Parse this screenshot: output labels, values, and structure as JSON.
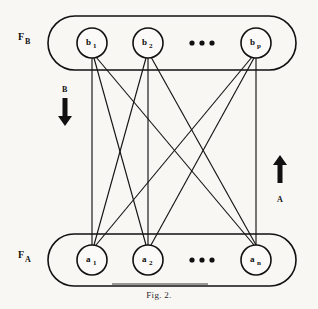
{
  "figure": {
    "caption": "Fig. 2.",
    "background_color": "#f8f7f4",
    "ink_color": "#111111"
  },
  "fields": {
    "top": {
      "label_main": "F",
      "label_sub": "B",
      "name": "F_B"
    },
    "bottom": {
      "label_main": "F",
      "label_sub": "A",
      "name": "F_A"
    }
  },
  "nodes": {
    "top_layer": [
      {
        "main": "b",
        "sub": "1",
        "cx": 92,
        "cy": 43
      },
      {
        "main": "b",
        "sub": "2",
        "cx": 148,
        "cy": 43
      },
      {
        "main": "b",
        "sub": "p",
        "cx": 256,
        "cy": 43
      }
    ],
    "bottom_layer": [
      {
        "main": "a",
        "sub": "1",
        "cx": 92,
        "cy": 260
      },
      {
        "main": "a",
        "sub": "2",
        "cx": 148,
        "cy": 260
      },
      {
        "main": "a",
        "sub": "n",
        "cx": 256,
        "cy": 260
      }
    ],
    "radius": 15
  },
  "ellipsis": {
    "glyph": "•",
    "count": 3,
    "top_y": 43,
    "bottom_y": 260,
    "x_positions": [
      192,
      202,
      212
    ]
  },
  "edges": {
    "description": "fully connected bipartite links",
    "pairs": [
      [
        0,
        0
      ],
      [
        0,
        1
      ],
      [
        0,
        2
      ],
      [
        1,
        0
      ],
      [
        1,
        1
      ],
      [
        1,
        2
      ],
      [
        2,
        0
      ],
      [
        2,
        1
      ],
      [
        2,
        2
      ]
    ]
  },
  "flow_arrows": {
    "down": {
      "label": "B",
      "direction": "down",
      "x": 65
    },
    "up": {
      "label": "A",
      "direction": "up",
      "x": 280
    }
  }
}
